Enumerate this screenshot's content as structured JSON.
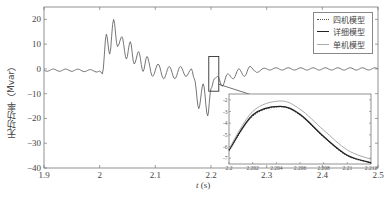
{
  "chart_data": {
    "type": "line",
    "title": "",
    "xlabel": "t (s)",
    "ylabel": "无功功率（Mvar）",
    "xlim": [
      1.9,
      2.5
    ],
    "ylim": [
      -40,
      25
    ],
    "xticks": [
      "1.9",
      "2",
      "2.1",
      "2.2",
      "2.3",
      "2.4",
      "2.5"
    ],
    "yticks": [
      "20",
      "10",
      "0",
      "-10",
      "-20",
      "-30",
      "-40"
    ],
    "grid": false,
    "legend_position": "upper right",
    "legend": [
      "四机模型",
      "详细模型",
      "单机模型"
    ],
    "series": [
      {
        "name": "四机模型",
        "style": "dotted",
        "color": "#555555"
      },
      {
        "name": "详细模型",
        "style": "solid",
        "color": "#222222"
      },
      {
        "name": "单机模型",
        "style": "solid",
        "color": "#aaaaaa"
      }
    ],
    "main_curve": {
      "x": [
        1.9,
        1.95,
        2.0,
        2.005,
        2.012,
        2.018,
        2.025,
        2.032,
        2.04,
        2.048,
        2.055,
        2.062,
        2.07,
        2.078,
        2.085,
        2.095,
        2.105,
        2.115,
        2.125,
        2.135,
        2.145,
        2.155,
        2.165,
        2.17,
        2.178,
        2.186,
        2.194,
        2.2,
        2.206,
        2.212,
        2.22,
        2.23,
        2.24,
        2.25,
        2.26,
        2.27,
        2.28,
        2.3,
        2.35,
        2.4,
        2.45,
        2.5
      ],
      "y": [
        -0.5,
        -0.5,
        -0.8,
        -2,
        14,
        6,
        20,
        9,
        13,
        4,
        11,
        2,
        7,
        -1,
        5,
        -3,
        2,
        -4,
        1,
        -4,
        1,
        -3,
        0,
        -4,
        -16,
        -6,
        -19,
        -8,
        -4,
        -3,
        -7,
        -2,
        -4,
        0,
        -3,
        1,
        -1,
        0,
        0,
        0,
        0,
        0
      ]
    },
    "zoom_box": {
      "x": [
        2.196,
        2.214
      ],
      "y": [
        -9,
        5
      ]
    },
    "inset": {
      "xlim": [
        2.2,
        2.212
      ],
      "ylim": [
        -7.5,
        -1.5
      ],
      "xticks": [
        "2.2",
        "2.202",
        "2.204",
        "2.206",
        "2.208",
        "2.21",
        "2.212"
      ],
      "yticks": [
        "-2",
        "-3",
        "-4",
        "-5",
        "-6",
        "-7"
      ],
      "series": [
        {
          "name": "四机模型",
          "x": [
            2.2,
            2.202,
            2.2043,
            2.206,
            2.208,
            2.21,
            2.212
          ],
          "y": [
            -6.4,
            -3.4,
            -2.6,
            -3.3,
            -5.2,
            -6.8,
            -7.4
          ]
        },
        {
          "name": "详细模型",
          "x": [
            2.2,
            2.202,
            2.2043,
            2.206,
            2.208,
            2.21,
            2.212
          ],
          "y": [
            -6.3,
            -3.3,
            -2.55,
            -3.25,
            -5.15,
            -6.75,
            -7.4
          ]
        },
        {
          "name": "单机模型",
          "x": [
            2.2,
            2.202,
            2.2043,
            2.206,
            2.208,
            2.21,
            2.212
          ],
          "y": [
            -6.2,
            -3.0,
            -2.1,
            -2.8,
            -4.6,
            -6.3,
            -7.1
          ]
        }
      ]
    }
  }
}
